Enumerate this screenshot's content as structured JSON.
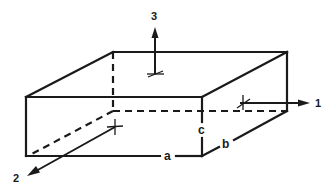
{
  "diagram": {
    "type": "rectangular-prism-with-principal-axes",
    "axes": [
      {
        "id": "1",
        "label": "1",
        "direction": "right"
      },
      {
        "id": "2",
        "label": "2",
        "direction": "front-left"
      },
      {
        "id": "3",
        "label": "3",
        "direction": "up"
      }
    ],
    "dimensions": [
      {
        "id": "a",
        "label": "a",
        "edge": "front-bottom (length along axis 1)"
      },
      {
        "id": "b",
        "label": "b",
        "edge": "right-bottom (depth along axis 2)"
      },
      {
        "id": "c",
        "label": "c",
        "edge": "front-right vertical (height along axis 3)"
      }
    ],
    "colors": {
      "line": "#1a1a1a",
      "background": "#ffffff"
    }
  }
}
